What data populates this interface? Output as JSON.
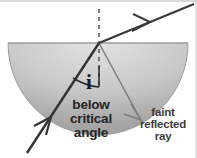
{
  "figure": {
    "background_color": "#ffffff",
    "width": 197,
    "height": 158
  },
  "medium": {
    "shape": "semicircular-dome",
    "name": "glass-block",
    "fill_top_color": "#d8d8d8",
    "fill_bottom_color": "#a9a9a9",
    "edge_color": "#9a9a9a",
    "flat_top_y": 43,
    "left_x": 8,
    "right_x": 188,
    "bottom_y": 135
  },
  "labels": {
    "angle_of_incidence": "i",
    "below_critical_angle": [
      "below",
      "critical",
      "angle"
    ],
    "faint_reflected_ray": [
      "faint",
      "reflected",
      "ray"
    ]
  },
  "rays": {
    "incident": {
      "name": "incident-ray",
      "color": "#333333",
      "from": [
        27,
        152
      ],
      "to": [
        99,
        43
      ],
      "arrow_at": [
        50,
        117
      ],
      "width": 2.4
    },
    "refracted": {
      "name": "refracted-ray",
      "color": "#3a3a3a",
      "from": [
        99,
        43
      ],
      "to": [
        193,
        4
      ],
      "arrow_at": [
        147,
        23
      ],
      "width": 2.2
    },
    "reflected": {
      "name": "faint-reflected-ray",
      "color": "#7d7d7d",
      "from": [
        99,
        43
      ],
      "to": [
        143,
        124
      ],
      "arrow_at": [
        140,
        118
      ],
      "width": 1.5
    },
    "normal": {
      "name": "normal-line",
      "color": "#4a4a4a",
      "from": [
        99,
        9
      ],
      "to": [
        99,
        88
      ],
      "dash": "4 4",
      "width": 1.4
    }
  },
  "angle_marker": {
    "name": "angle-arc-i",
    "color": "#2b2b2b",
    "center": [
      99,
      43
    ],
    "radius": 44
  },
  "frame": {
    "top_border_color": "#b3b3b3",
    "right_border_color": "#c8c8c8"
  }
}
